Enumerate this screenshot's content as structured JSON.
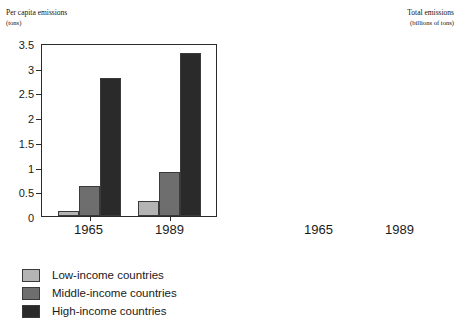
{
  "legend": {
    "items": [
      {
        "key": "low",
        "label": "Low-income countries",
        "color": "#b4b4b4"
      },
      {
        "key": "mid",
        "label": "Middle-income countries",
        "color": "#6e6e6e"
      },
      {
        "key": "high",
        "label": "High-income countries",
        "color": "#2a2a2a"
      }
    ]
  },
  "chart_data": [
    {
      "type": "bar",
      "title": "Per capita emissions",
      "subtitle": "(tons)",
      "title_align": "left",
      "axis_side": "left",
      "xlabel": "",
      "ylabel": "Per capita emissions (tons)",
      "ylim": [
        0,
        3.5
      ],
      "yticks": [
        0,
        0.5,
        1,
        1.5,
        2,
        2.5,
        3,
        3.5
      ],
      "ytick_labels": [
        "0",
        "0.5",
        "1",
        "1.5",
        "2",
        "2.5",
        "3",
        "3.5"
      ],
      "grid": false,
      "legend_position": "below",
      "categories": [
        "1965",
        "1989"
      ],
      "series": [
        {
          "name": "Low-income countries",
          "values": [
            0.1,
            0.3
          ]
        },
        {
          "name": "Middle-income countries",
          "values": [
            0.6,
            0.9
          ]
        },
        {
          "name": "High-income countries",
          "values": [
            2.8,
            3.3
          ]
        }
      ]
    },
    {
      "type": "bar",
      "title": "Total emissions",
      "subtitle": "(billions of tons)",
      "title_align": "right",
      "axis_side": "right",
      "xlabel": "",
      "ylabel": "Total emissions (billions of tons)",
      "ylim": [
        0,
        3
      ],
      "yticks": [
        0,
        0.5,
        1,
        1.5,
        2,
        2.5,
        3
      ],
      "ytick_labels": [
        "0",
        "0.5",
        "1",
        "1.5",
        "2",
        "2.5",
        "3"
      ],
      "grid": false,
      "legend_position": "below",
      "categories": [
        "1965",
        "1989"
      ],
      "series": [
        {
          "name": "Low-income countries",
          "values": [
            0.3,
            0.85
          ]
        },
        {
          "name": "Middle-income countries",
          "values": [
            0.5,
            1.05
          ]
        },
        {
          "name": "High-income countries",
          "values": [
            1.9,
            2.7
          ]
        }
      ]
    }
  ]
}
